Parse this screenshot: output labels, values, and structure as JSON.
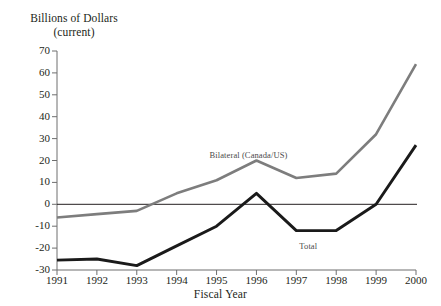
{
  "chart_data": {
    "type": "line",
    "title": "Billions of Dollars (current)",
    "title_line1": "Billions of Dollars",
    "title_line2": "(current)",
    "xlabel": "Fiscal Year",
    "ylabel": "Billions of Dollars (current)",
    "x": [
      "1991",
      "1992",
      "1993",
      "1994",
      "1995",
      "1996",
      "1997",
      "1998",
      "1999",
      "2000"
    ],
    "categories": [
      "1991",
      "1992",
      "1993",
      "1994",
      "1995",
      "1996",
      "1997",
      "1998",
      "1999",
      "2000"
    ],
    "ylim": [
      -30,
      70
    ],
    "yticks": [
      "70",
      "60",
      "50",
      "40",
      "30",
      "20",
      "10",
      "0",
      "-10",
      "-20",
      "-30"
    ],
    "ytick_values": [
      70,
      60,
      50,
      40,
      30,
      20,
      10,
      0,
      -10,
      -20,
      -30
    ],
    "grid": false,
    "legend_position": "inline-annotation",
    "zero_line": true,
    "series": [
      {
        "name": "Bilateral (Canada/US)",
        "color": "#7d7d7d",
        "values": [
          -6,
          -4.5,
          -3,
          5,
          11,
          20,
          12,
          14,
          32,
          64
        ],
        "label_x": "1995",
        "label_text": "Bilateral (Canada/US)"
      },
      {
        "name": "Total",
        "color": "#1a1a1a",
        "values": [
          -25.5,
          -25,
          -28,
          -19,
          -10,
          5,
          -12,
          -12,
          0,
          27
        ],
        "label_x": "1997",
        "label_text": "Total"
      }
    ],
    "annotations": [
      {
        "text": "Bilateral (Canada/US)",
        "series": "Bilateral (Canada/US)"
      },
      {
        "text": "Total",
        "series": "Total"
      }
    ]
  },
  "axis": {
    "title_line1": "Billions of Dollars",
    "title_line2": "(current)",
    "x_name": "Fiscal Year"
  },
  "colors": {
    "bilateral": "#7d7d7d",
    "total": "#1a1a1a",
    "axis": "#6e6e6e",
    "text": "#231f20"
  }
}
